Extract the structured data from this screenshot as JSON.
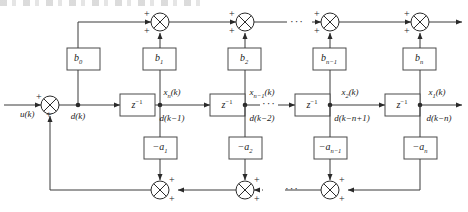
{
  "figure": {
    "kind": "block-diagram",
    "top_scan_artifact": true
  },
  "signals": {
    "input": "u(k)",
    "node_dk": "d(k)",
    "taps": [
      {
        "state": "x",
        "state_sub": "n",
        "state_tail": "(k)",
        "delayed": "d(k−1)"
      },
      {
        "state": "x",
        "state_sub": "n−1",
        "state_tail": "(k)",
        "delayed": "d(k−2)"
      },
      {
        "state": "x",
        "state_sub": "2",
        "state_tail": "(k)",
        "delayed": "d(k−n+1)"
      },
      {
        "state": "x",
        "state_sub": "1",
        "state_tail": "(k)",
        "delayed": "d(k−n)"
      }
    ]
  },
  "delays": {
    "label_base": "z",
    "label_exp": "−1",
    "count": 4
  },
  "feedforward": {
    "label": "b",
    "gains": [
      {
        "base": "b",
        "sub": "0"
      },
      {
        "base": "b",
        "sub": "1"
      },
      {
        "base": "b",
        "sub": "2"
      },
      {
        "base": "b",
        "sub": "n−1"
      },
      {
        "base": "b",
        "sub": "n"
      }
    ]
  },
  "feedback": {
    "label": "-a",
    "gains": [
      {
        "base": "−a",
        "sub": "1"
      },
      {
        "base": "−a",
        "sub": "2"
      },
      {
        "base": "−a",
        "sub": "n−1"
      },
      {
        "base": "−a",
        "sub": "n"
      }
    ]
  },
  "adders": {
    "plus": "+",
    "top_count": 4,
    "bottom_count": 3,
    "input_count": 1
  },
  "ellipsis": {
    "top": "···",
    "middle": "···",
    "bottom": "···"
  }
}
